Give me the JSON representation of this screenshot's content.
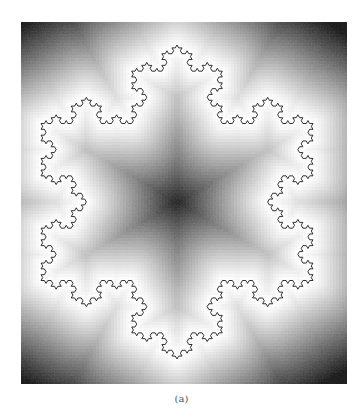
{
  "figure": {
    "caption": "(a)",
    "koch": {
      "level": 4,
      "center": [
        156,
        180
      ],
      "radius": 157,
      "stroke_color": "#1a1a1a",
      "stroke_width": 0.9
    },
    "field": {
      "near_color": "#ffffff",
      "far_color": "#1e1e1e",
      "falloff": 95
    }
  }
}
